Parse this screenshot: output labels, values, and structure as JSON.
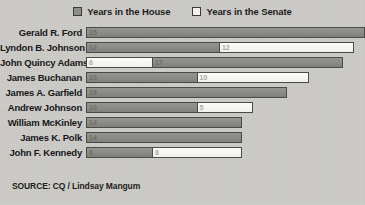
{
  "legend": {
    "items": [
      {
        "label": "Years in the House",
        "key": "house",
        "color": "#8b8b88",
        "swatch": "filled-square-icon"
      },
      {
        "label": "Years in the Senate",
        "key": "senate",
        "color": "#f4f3f0",
        "swatch": "empty-square-icon"
      }
    ]
  },
  "source": {
    "text": "SOURCE: CQ / Lindsay Mangum"
  },
  "chart_data": {
    "type": "bar",
    "orientation": "horizontal",
    "stacked": true,
    "title": "",
    "subtitle": "",
    "xlabel": "",
    "ylabel": "",
    "xlim": [
      0,
      25
    ],
    "grid": false,
    "legend_position": "top-center",
    "categories": [
      "Gerald R. Ford",
      "Lyndon B. Johnson",
      "John Quincy Adams",
      "James Buchanan",
      "James A. Garfield",
      "Andrew Johnson",
      "William McKinley",
      "James K. Polk",
      "John F. Kennedy"
    ],
    "series": [
      {
        "name": "Years in the House",
        "values": [
          25,
          12,
          17,
          10,
          18,
          10,
          14,
          14,
          6
        ]
      },
      {
        "name": "Years in the Senate",
        "values": [
          0,
          12,
          6,
          10,
          0,
          5,
          0,
          0,
          8
        ]
      }
    ],
    "totals": [
      25,
      24,
      23,
      20,
      18,
      15,
      14,
      14,
      14
    ],
    "rows": [
      {
        "name": "Gerald R. Ford",
        "segments": [
          {
            "series": "house",
            "value": 25,
            "label": "25"
          }
        ]
      },
      {
        "name": "Lyndon B. Johnson",
        "segments": [
          {
            "series": "house",
            "value": 12,
            "label": "12"
          },
          {
            "series": "senate",
            "value": 12,
            "label": "12"
          }
        ]
      },
      {
        "name": "John Quincy Adams",
        "segments": [
          {
            "series": "senate",
            "value": 6,
            "label": "6"
          },
          {
            "series": "house",
            "value": 17,
            "label": "17"
          }
        ]
      },
      {
        "name": "James Buchanan",
        "segments": [
          {
            "series": "house",
            "value": 10,
            "label": "10"
          },
          {
            "series": "senate",
            "value": 10,
            "label": "10"
          }
        ]
      },
      {
        "name": "James A. Garfield",
        "segments": [
          {
            "series": "house",
            "value": 18,
            "label": "18"
          }
        ]
      },
      {
        "name": "Andrew Johnson",
        "segments": [
          {
            "series": "house",
            "value": 10,
            "label": "10"
          },
          {
            "series": "senate",
            "value": 5,
            "label": "5"
          }
        ]
      },
      {
        "name": "William McKinley",
        "segments": [
          {
            "series": "house",
            "value": 14,
            "label": "14"
          }
        ]
      },
      {
        "name": "James K. Polk",
        "segments": [
          {
            "series": "house",
            "value": 14,
            "label": "14"
          }
        ]
      },
      {
        "name": "John F. Kennedy",
        "segments": [
          {
            "series": "house",
            "value": 6,
            "label": "6"
          },
          {
            "series": "senate",
            "value": 8,
            "label": "8"
          }
        ]
      }
    ]
  }
}
